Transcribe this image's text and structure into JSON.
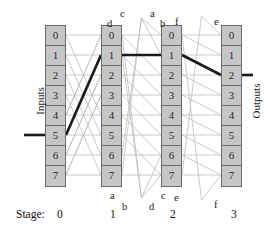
{
  "figure": {
    "input_label": "Inputs",
    "output_label": "Outputs",
    "stage_label": "Stage:",
    "stages": [
      "0",
      "1",
      "2",
      "3"
    ],
    "node_labels": [
      "0",
      "1",
      "2",
      "3",
      "4",
      "5",
      "6",
      "7"
    ],
    "colors": {
      "node_fill": "#c6c6c6",
      "node_border": "#6b6b6b",
      "wire": "#b9b9b9",
      "highlight": "#1a1a1a",
      "text": "#1a1a1a",
      "background": "#ffffff"
    },
    "columns": [
      {
        "stage": "0",
        "x": 45,
        "nodes": [
          "0",
          "1",
          "2",
          "3",
          "4",
          "5",
          "6",
          "7"
        ]
      },
      {
        "stage": "1",
        "x": 101,
        "nodes": [
          "0",
          "1",
          "2",
          "3",
          "4",
          "5",
          "6",
          "7"
        ]
      },
      {
        "stage": "2",
        "x": 161,
        "nodes": [
          "0",
          "1",
          "2",
          "3",
          "4",
          "5",
          "6",
          "7"
        ]
      },
      {
        "stage": "3",
        "x": 221,
        "nodes": [
          "0",
          "1",
          "2",
          "3",
          "4",
          "5",
          "6",
          "7"
        ]
      }
    ],
    "wrap_labels_top": [
      {
        "text": "d",
        "x": 107,
        "y": 18
      },
      {
        "text": "c",
        "x": 120,
        "y": 8
      },
      {
        "text": "a",
        "x": 150,
        "y": 8
      },
      {
        "text": "b",
        "x": 160,
        "y": 18
      },
      {
        "text": "f",
        "x": 175,
        "y": 16
      },
      {
        "text": "e",
        "x": 214,
        "y": 16
      }
    ],
    "wrap_labels_bottom": [
      {
        "text": "a",
        "x": 110,
        "y": 190
      },
      {
        "text": "b",
        "x": 122,
        "y": 201
      },
      {
        "text": "d",
        "x": 149,
        "y": 201
      },
      {
        "text": "c",
        "x": 161,
        "y": 190
      },
      {
        "text": "e",
        "x": 174,
        "y": 192
      },
      {
        "text": "f",
        "x": 214,
        "y": 199
      }
    ],
    "highlight_path": {
      "description": "routed path from input 5 to output 2",
      "input_port": "5",
      "hops": [
        "0:5",
        "1:1",
        "2:1",
        "3:2"
      ],
      "output_port": "2"
    }
  }
}
